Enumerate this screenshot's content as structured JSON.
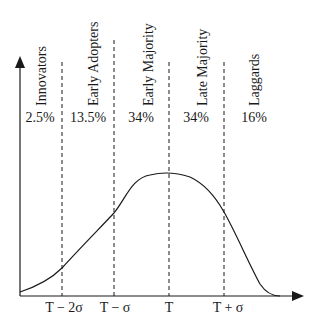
{
  "diagram": {
    "categories": [
      {
        "label": "Innovators",
        "percent": "2.5%"
      },
      {
        "label": "Early Adopters",
        "percent": "13.5%"
      },
      {
        "label": "Early Majority",
        "percent": "34%"
      },
      {
        "label": "Late Majority",
        "percent": "34%"
      },
      {
        "label": "Laggards",
        "percent": "16%"
      }
    ],
    "x_ticks": [
      "T − 2σ",
      "T − σ",
      "T",
      "T + σ"
    ],
    "colors": {
      "line": "#1a1a1a",
      "background": "#ffffff"
    }
  }
}
